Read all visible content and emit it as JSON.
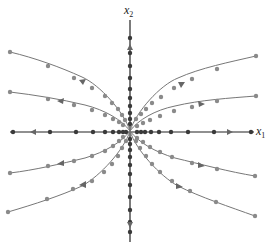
{
  "diagram": {
    "type": "phase_portrait",
    "axes": {
      "x_label": "x",
      "x_sub": "1",
      "y_label": "x",
      "y_sub": "2"
    },
    "origin": [
      130,
      131
    ],
    "colors": {
      "trajectory": "#777777",
      "axis": "#222222",
      "point": "#8a8a8a"
    },
    "trajectories": [
      {
        "name": "upper-left-outer",
        "end": [
          10,
          52
        ],
        "direction": "outward"
      },
      {
        "name": "upper-left-inner",
        "end": [
          10,
          92
        ],
        "direction": "outward"
      },
      {
        "name": "upper-right-outer",
        "end": [
          256,
          56
        ],
        "direction": "outward"
      },
      {
        "name": "upper-right-inner",
        "end": [
          256,
          96
        ],
        "direction": "outward"
      },
      {
        "name": "lower-left-inner",
        "end": [
          10,
          173
        ],
        "direction": "outward"
      },
      {
        "name": "lower-left-outer",
        "end": [
          8,
          212
        ],
        "direction": "outward"
      },
      {
        "name": "lower-right-inner",
        "end": [
          255,
          176
        ],
        "direction": "outward"
      },
      {
        "name": "lower-right-outer",
        "end": [
          255,
          216
        ],
        "direction": "outward"
      },
      {
        "name": "x1-axis-negative",
        "end": [
          12,
          132
        ],
        "direction": "outward"
      },
      {
        "name": "x1-axis-positive",
        "end": [
          252,
          132
        ],
        "direction": "outward"
      },
      {
        "name": "x2-axis-positive",
        "end": [
          130,
          20
        ],
        "direction": "outward"
      },
      {
        "name": "x2-axis-negative",
        "end": [
          130,
          242
        ],
        "direction": "outward"
      }
    ]
  }
}
